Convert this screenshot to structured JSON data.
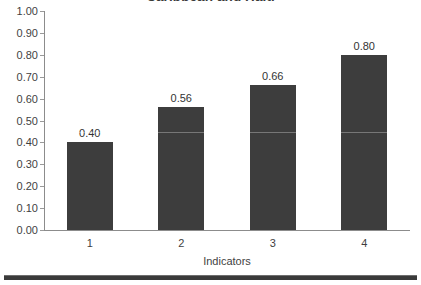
{
  "chart_data": {
    "type": "bar",
    "title": "Caribbean and Haiti",
    "xlabel": "Indicators",
    "ylabel": "",
    "categories": [
      "1",
      "2",
      "3",
      "4"
    ],
    "values": [
      0.4,
      0.56,
      0.66,
      0.8
    ],
    "value_labels": [
      "0.40",
      "0.56",
      "0.66",
      "0.80"
    ],
    "ylim": [
      0.0,
      1.0
    ],
    "ytick_step": 0.1,
    "ytick_labels": [
      "1.00",
      "0.90",
      "0.80",
      "0.70",
      "0.60",
      "0.50",
      "0.40",
      "0.30",
      "0.20",
      "0.10",
      "0.00"
    ],
    "grid": false,
    "legend": "none",
    "bar_color": "#3d3d3d",
    "axis_color": "#8c8c8c",
    "text_color": "#3f3f3f",
    "background_color": "#ffffff"
  },
  "footer": {
    "rule_color": "#3a3a3a"
  }
}
